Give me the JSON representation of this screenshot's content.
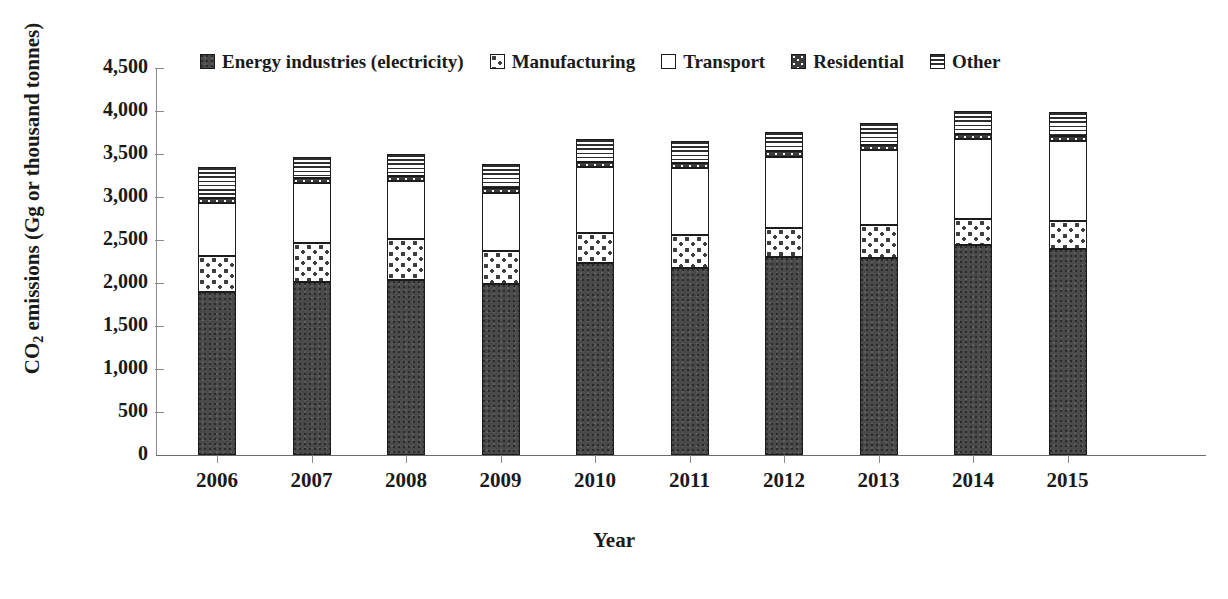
{
  "chart_data": {
    "type": "bar",
    "subtype": "stacked-bar",
    "title": "",
    "xlabel": "Year",
    "ylabel": "CO2 emissions (Gg or thousand tonnes)",
    "ylabel_parts": {
      "prefix": "CO",
      "subscript": "2",
      "suffix": " emissions (Gg or thousand tonnes)"
    },
    "categories": [
      "2006",
      "2007",
      "2008",
      "2009",
      "2010",
      "2011",
      "2012",
      "2013",
      "2014",
      "2015"
    ],
    "ylim": [
      0,
      4500
    ],
    "ytick_step": 500,
    "ytick_labels": [
      "4,500",
      "4,000",
      "3,500",
      "3,000",
      "2,500",
      "2,000",
      "1,500",
      "1,000",
      "500",
      "0"
    ],
    "ytick_values": [
      4500,
      4000,
      3500,
      3000,
      2500,
      2000,
      1500,
      1000,
      500,
      0
    ],
    "grid": false,
    "legend_position": "top",
    "stack_order_bottom_to_top": [
      "Energy industries (electricity)",
      "Manufacturing",
      "Transport",
      "Residential",
      "Other"
    ],
    "series": [
      {
        "name": "Energy industries (electricity)",
        "key": "energy",
        "values": [
          1900,
          2010,
          2030,
          1990,
          2230,
          2170,
          2300,
          2290,
          2440,
          2390
        ]
      },
      {
        "name": "Manufacturing",
        "key": "manufacturing",
        "values": [
          410,
          460,
          480,
          380,
          350,
          390,
          340,
          390,
          300,
          330
        ]
      },
      {
        "name": "Transport",
        "key": "transport",
        "values": [
          620,
          690,
          680,
          680,
          770,
          780,
          830,
          870,
          930,
          930
        ]
      },
      {
        "name": "Residential",
        "key": "residential",
        "values": [
          60,
          60,
          60,
          60,
          60,
          60,
          60,
          60,
          60,
          60
        ]
      },
      {
        "name": "Other",
        "key": "other",
        "values": [
          360,
          240,
          250,
          270,
          270,
          250,
          230,
          250,
          270,
          280
        ]
      }
    ],
    "totals": [
      3350,
      3460,
      3500,
      3380,
      3680,
      3650,
      3760,
      3860,
      4000,
      3990
    ]
  },
  "legend": {
    "items": [
      {
        "label": "Energy industries (electricity)",
        "fill_class": "fill-energy",
        "swatch_name": "legend-swatch-energy"
      },
      {
        "label": "Manufacturing",
        "fill_class": "fill-manufacturing",
        "swatch_name": "legend-swatch-manufacturing"
      },
      {
        "label": "Transport",
        "fill_class": "fill-transport",
        "swatch_name": "legend-swatch-transport"
      },
      {
        "label": "Residential",
        "fill_class": "fill-residential",
        "swatch_name": "legend-swatch-residential"
      },
      {
        "label": "Other",
        "fill_class": "fill-other",
        "swatch_name": "legend-swatch-other"
      }
    ]
  },
  "axes": {
    "x_title": "Year",
    "y_title_prefix": "CO",
    "y_title_sub": "2",
    "y_title_suffix": " emissions (Gg or thousand tonnes)"
  },
  "colors": {
    "energy": "#4a4a4a",
    "manufacturing": "#ffffff",
    "transport": "#ffffff",
    "residential": "#3a3a3a",
    "other": "#ffffff",
    "outline": "#1c1c1c",
    "axis": "#8a8a8a",
    "text": "#1a1a1a",
    "background": "#ffffff"
  }
}
